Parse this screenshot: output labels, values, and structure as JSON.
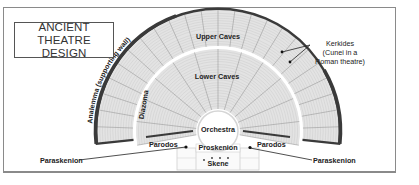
{
  "title": {
    "line1": "ANCIENT THEATRE",
    "line2": "DESIGN"
  },
  "labels": {
    "upper_caves": "Upper Caves",
    "lower_caves": "Lower Caves",
    "orchestra": "Orchestra",
    "diazoma": "Diazoma",
    "analemma": "Analemma (supporting wall)",
    "kerkides_line1": "Kerkides",
    "kerkides_line2": "(Cunei in a",
    "kerkides_line3": "Roman theatre)",
    "parodos_left": "Parodos",
    "parodos_right": "Parodos",
    "proskenion": "Proskenion",
    "skene": "Skene",
    "paraskenion_left": "Paraskenion",
    "paraskenion_right": "Paraskenion"
  },
  "colors": {
    "frame": "#8a8a8a",
    "seating_fill": "#e3e3e3",
    "seating_lines": "#9a9a9a",
    "wall": "#3a3a3a",
    "text": "#222222"
  }
}
